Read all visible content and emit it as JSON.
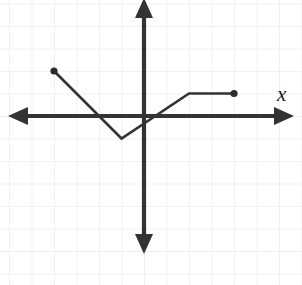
{
  "figure": {
    "name": "piecewise-linear-function-graph",
    "background_color": "#ffffff",
    "ink_color": "#333333",
    "grid_color": "#e3e3e8",
    "axis_label_x": "x",
    "axis_label_y": ""
  },
  "chart_data": {
    "type": "line",
    "title": "",
    "subtitle": "",
    "xlabel": "x",
    "ylabel": "",
    "grid": true,
    "legend": "none",
    "xlim": [
      -6.2,
      7.0
    ],
    "ylim": [
      -7.5,
      5.0
    ],
    "x_tick_step": 1,
    "y_tick_step": 1,
    "tick_labels_shown": false,
    "axes": {
      "x_axis": {
        "arrow_left": true,
        "arrow_right": true,
        "y": 0
      },
      "y_axis": {
        "arrow_up": true,
        "arrow_down": true,
        "x": 0
      }
    },
    "series": [
      {
        "name": "piecewise-linear-path",
        "closed_endpoints": [
          [
            -4,
            2
          ],
          [
            4,
            1
          ]
        ],
        "vertices": [
          [
            -4,
            2
          ],
          [
            -1,
            -1
          ],
          [
            2,
            1
          ],
          [
            4,
            1
          ]
        ],
        "x": [
          -4,
          -1,
          2,
          4
        ],
        "values": [
          2,
          -1,
          1,
          1
        ],
        "segments": [
          {
            "from": [
              -4,
              2
            ],
            "to": [
              -1,
              -1
            ],
            "slope": -1
          },
          {
            "from": [
              -1,
              -1
            ],
            "to": [
              2,
              1
            ],
            "slope": 0.6667
          },
          {
            "from": [
              2,
              1
            ],
            "to": [
              4,
              1
            ],
            "slope": 0
          }
        ]
      }
    ],
    "annotations": [
      {
        "kind": "endpoint-dot",
        "at": [
          -4,
          2
        ],
        "filled": true
      },
      {
        "kind": "endpoint-dot",
        "at": [
          4,
          1
        ],
        "filled": true
      }
    ]
  }
}
